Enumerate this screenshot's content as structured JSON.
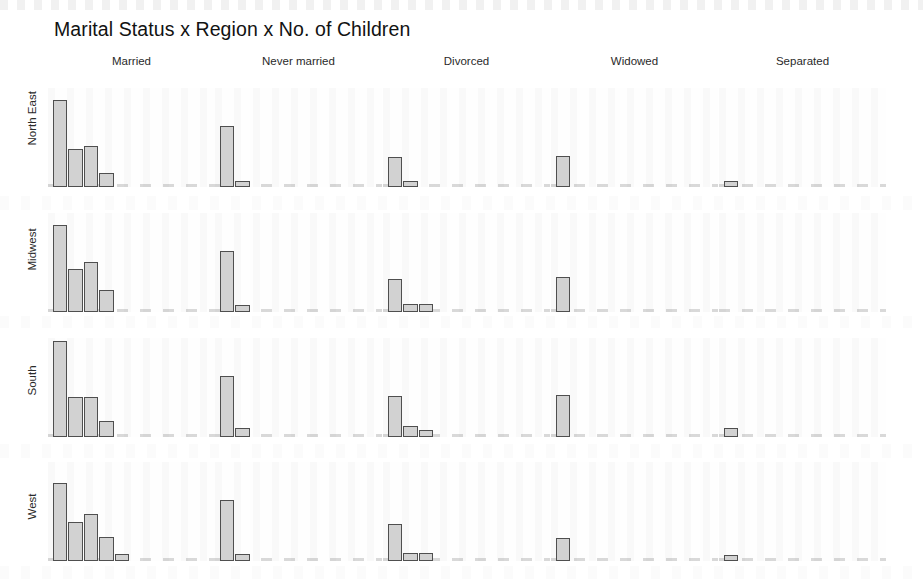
{
  "chart_data": {
    "type": "bar",
    "title": "Marital Status x Region x No. of Children",
    "xlabel": "",
    "ylabel": "",
    "grid": false,
    "legend": "none",
    "layout": "trellis-facet-grid",
    "facet_columns_var": "Marital Status",
    "facet_rows_var": "Region",
    "bar_var": "No. of Children",
    "categories": [
      "0",
      "1",
      "2",
      "3",
      "4",
      "5",
      "6",
      "7"
    ],
    "ylim": [
      0,
      100
    ],
    "columns": [
      "Married",
      "Never married",
      "Divorced",
      "Widowed",
      "Separated"
    ],
    "rows": [
      "North East",
      "Midwest",
      "South",
      "West"
    ],
    "panels": [
      {
        "row": "North East",
        "col": "Married",
        "values": [
          88,
          38,
          41,
          14,
          0,
          0,
          0,
          0
        ]
      },
      {
        "row": "North East",
        "col": "Never married",
        "values": [
          62,
          6,
          0,
          0,
          0,
          0,
          0,
          0
        ]
      },
      {
        "row": "North East",
        "col": "Divorced",
        "values": [
          30,
          6,
          0,
          0,
          0,
          0,
          0,
          0
        ]
      },
      {
        "row": "North East",
        "col": "Widowed",
        "values": [
          31,
          0,
          0,
          0,
          0,
          0,
          0,
          0
        ]
      },
      {
        "row": "North East",
        "col": "Separated",
        "values": [
          6,
          0,
          0,
          0,
          0,
          0,
          0,
          0
        ]
      },
      {
        "row": "Midwest",
        "col": "Married",
        "values": [
          88,
          43,
          51,
          22,
          0,
          0,
          0,
          0
        ]
      },
      {
        "row": "Midwest",
        "col": "Never married",
        "values": [
          62,
          7,
          0,
          0,
          0,
          0,
          0,
          0
        ]
      },
      {
        "row": "Midwest",
        "col": "Divorced",
        "values": [
          33,
          8,
          8,
          0,
          0,
          0,
          0,
          0
        ]
      },
      {
        "row": "Midwest",
        "col": "Widowed",
        "values": [
          35,
          0,
          0,
          0,
          0,
          0,
          0,
          0
        ]
      },
      {
        "row": "Midwest",
        "col": "Separated",
        "values": [
          0,
          0,
          0,
          0,
          0,
          0,
          0,
          0
        ]
      },
      {
        "row": "South",
        "col": "Married",
        "values": [
          97,
          40,
          40,
          16,
          0,
          0,
          0,
          0
        ]
      },
      {
        "row": "South",
        "col": "Never married",
        "values": [
          62,
          9,
          0,
          0,
          0,
          0,
          0,
          0
        ]
      },
      {
        "row": "South",
        "col": "Divorced",
        "values": [
          41,
          11,
          7,
          0,
          0,
          0,
          0,
          0
        ]
      },
      {
        "row": "South",
        "col": "Widowed",
        "values": [
          42,
          0,
          0,
          0,
          0,
          0,
          0,
          0
        ]
      },
      {
        "row": "South",
        "col": "Separated",
        "values": [
          9,
          0,
          0,
          0,
          0,
          0,
          0,
          0
        ]
      },
      {
        "row": "West",
        "col": "Married",
        "values": [
          79,
          39,
          47,
          24,
          7,
          0,
          0,
          0
        ]
      },
      {
        "row": "West",
        "col": "Never married",
        "values": [
          62,
          7,
          0,
          0,
          0,
          0,
          0,
          0
        ]
      },
      {
        "row": "West",
        "col": "Divorced",
        "values": [
          37,
          8,
          8,
          0,
          0,
          0,
          0,
          0
        ]
      },
      {
        "row": "West",
        "col": "Widowed",
        "values": [
          23,
          0,
          0,
          0,
          0,
          0,
          0,
          0
        ]
      },
      {
        "row": "West",
        "col": "Separated",
        "values": [
          6,
          0,
          0,
          0,
          0,
          0,
          0,
          0
        ]
      }
    ],
    "colors": {
      "bar_fill": "#d2d2d2",
      "bar_stroke": "#4f4f4f",
      "text": "#2a2a2a",
      "background": "#ffffff"
    }
  },
  "chart": {
    "title": "Marital Status x Region x No. of Children",
    "column_headers": [
      "Married",
      "Never married",
      "Divorced",
      "Widowed",
      "Separated"
    ],
    "row_headers": [
      "North East",
      "Midwest",
      "South",
      "West"
    ]
  }
}
